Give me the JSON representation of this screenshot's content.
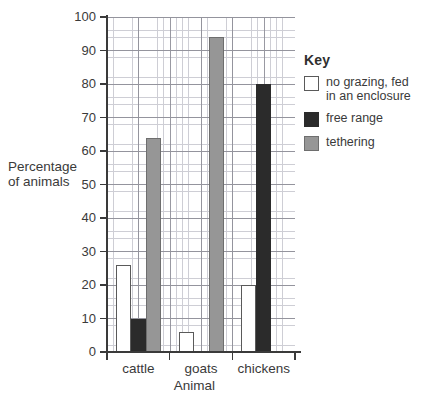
{
  "chart_data": {
    "type": "bar",
    "title": "",
    "xlabel": "Animal",
    "ylabel": "Percentage of animals",
    "ylim": [
      0,
      100
    ],
    "ytick_step": 10,
    "grid": true,
    "grid_minor_step": 2,
    "legend_position": "right",
    "categories": [
      "cattle",
      "goats",
      "chickens"
    ],
    "yticks": [
      "0",
      "10",
      "20",
      "30",
      "40",
      "50",
      "60",
      "70",
      "80",
      "90",
      "100"
    ],
    "series": [
      {
        "name": "no grazing, fed in an enclosure",
        "color": "#ffffff",
        "values": [
          26,
          6,
          20
        ]
      },
      {
        "name": "free range",
        "color": "#2b2b2b",
        "values": [
          10,
          0,
          80
        ]
      },
      {
        "name": "tethering",
        "color": "#969696",
        "values": [
          64,
          94,
          0
        ]
      }
    ]
  },
  "legend": {
    "title": "Key",
    "entries": [
      {
        "label": "no grazing, fed\nin an enclosure",
        "swatch": "white-square-icon"
      },
      {
        "label": "free range",
        "swatch": "black-square-icon"
      },
      {
        "label": "tethering",
        "swatch": "gray-square-icon"
      }
    ]
  },
  "axes": {
    "y_title_line1": "Percentage",
    "y_title_line2": "of animals",
    "x_title": "Animal"
  }
}
